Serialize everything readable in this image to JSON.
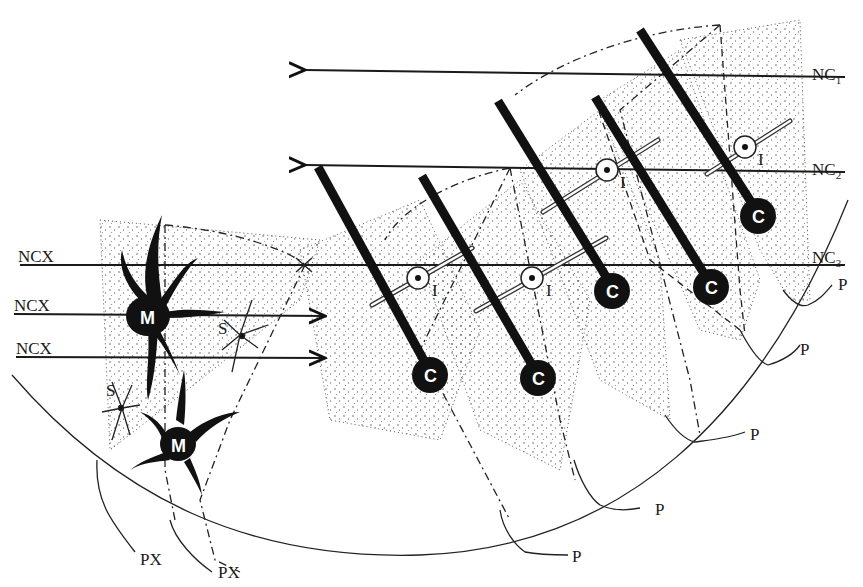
{
  "diagram": {
    "labels": {
      "nc1": {
        "main": "NC",
        "sub": "1"
      },
      "nc2": {
        "main": "NC",
        "sub": "2"
      },
      "nc3": {
        "main": "NC",
        "sub": "3"
      },
      "ncx_1": "NCX",
      "ncx_2": "NCX",
      "ncx_3": "NCX",
      "px_1": "PX",
      "px_2": "PX",
      "p_1": "P",
      "p_2": "P",
      "p_3": "P",
      "p_4": "P",
      "p_5": "P",
      "p_6": "P"
    },
    "cells": {
      "c_label": "C",
      "i_label": "I",
      "m_label": "M",
      "s_label": "S"
    },
    "colors": {
      "ink": "#111111",
      "background": "#ffffff"
    }
  }
}
